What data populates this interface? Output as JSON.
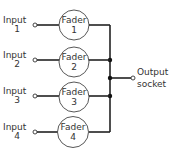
{
  "diagram": {
    "type": "audio-mixer-schematic",
    "inputs": [
      {
        "label": "Input",
        "number": "1"
      },
      {
        "label": "Input",
        "number": "2"
      },
      {
        "label": "Input",
        "number": "3"
      },
      {
        "label": "Input",
        "number": "4"
      }
    ],
    "faders": [
      {
        "label": "Fader",
        "number": "1"
      },
      {
        "label": "Fader",
        "number": "2"
      },
      {
        "label": "Fader",
        "number": "3"
      },
      {
        "label": "Fader",
        "number": "4"
      }
    ],
    "output": {
      "line1": "Output",
      "line2": "socket"
    },
    "colors": {
      "line": "#222222",
      "text": "#333333",
      "background": "#ffffff"
    }
  }
}
